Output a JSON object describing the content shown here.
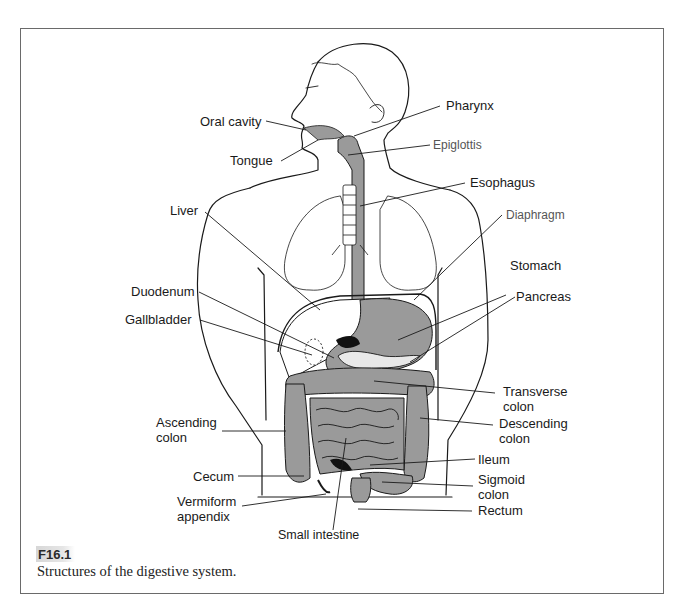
{
  "figure": {
    "number": "F16.1",
    "caption": "Structures of the digestive system."
  },
  "labels": {
    "oral_cavity": "Oral cavity",
    "tongue": "Tongue",
    "pharynx": "Pharynx",
    "epiglottis": "Epiglottis",
    "esophagus": "Esophagus",
    "liver": "Liver",
    "diaphragm": "Diaphragm",
    "stomach": "Stomach",
    "duodenum": "Duodenum",
    "gallbladder": "Gallbladder",
    "pancreas": "Pancreas",
    "transverse_colon": "Transverse\ncolon",
    "ascending_colon": "Ascending\ncolon",
    "descending_colon": "Descending\ncolon",
    "ileum": "Ileum",
    "cecum": "Cecum",
    "sigmoid_colon": "Sigmoid\ncolon",
    "vermiform_appendix": "Vermiform\nappendix",
    "rectum": "Rectum",
    "small_intestine": "Small intestine"
  },
  "colors": {
    "organ_fill": "#9a9a9a",
    "outline": "#1a1a1a",
    "frame": "#6a6a6a",
    "figure_tag_bg": "#d9d9d9"
  }
}
